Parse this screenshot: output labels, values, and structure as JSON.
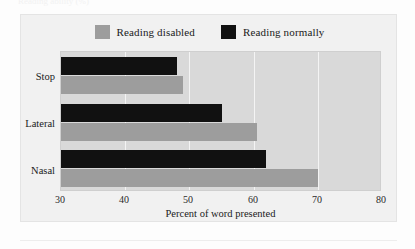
{
  "caption": {
    "clipped_text": "Reading ability (%)"
  },
  "legend": {
    "position": "top-center",
    "entries": [
      {
        "label": "Reading disabled",
        "color": "#9d9d9d",
        "swatch": "legend-swatch-gray"
      },
      {
        "label": "Reading normally",
        "color": "#111111",
        "swatch": "legend-swatch-black"
      }
    ]
  },
  "axes": {
    "x_title": "Percent of word presented",
    "x_ticks": [
      "30",
      "40",
      "50",
      "60",
      "70",
      "80"
    ],
    "y_categories": [
      "Stop",
      "Lateral",
      "Nasal"
    ]
  },
  "chart_data": {
    "type": "bar",
    "orientation": "horizontal",
    "title": "",
    "subtitle": "",
    "xlabel": "Percent of word presented",
    "ylabel": "",
    "xlim": [
      30,
      80
    ],
    "xticks": [
      30,
      40,
      50,
      60,
      70,
      80
    ],
    "grid": true,
    "grid_axis": "x",
    "legend": true,
    "legend_position": "top-center",
    "categories": [
      "Stop",
      "Lateral",
      "Nasal"
    ],
    "series": [
      {
        "name": "Reading normally",
        "color": "#111111",
        "values": [
          48,
          55,
          62
        ]
      },
      {
        "name": "Reading disabled",
        "color": "#9d9d9d",
        "values": [
          49,
          60.5,
          70
        ]
      }
    ],
    "series_order_within_group": [
      "Reading normally",
      "Reading disabled"
    ]
  },
  "colors": {
    "panel_background": "#f1f1f1",
    "plot_background": "#d9d9d9",
    "gridline": "#f4f4f4",
    "series_disabled": "#9d9d9d",
    "series_normal": "#111111",
    "text": "#1a1a1a"
  }
}
